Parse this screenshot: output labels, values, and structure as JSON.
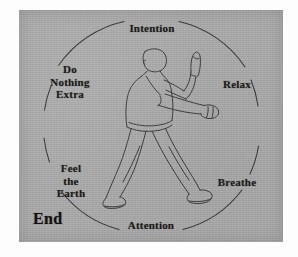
{
  "figure": {
    "background_color": "#a9a9a9",
    "ink_color": "#1d1b19",
    "page_color": "#fdfdfd"
  },
  "cycle": {
    "labels": [
      {
        "id": "intention",
        "text": "Intention",
        "position": "top"
      },
      {
        "id": "relax",
        "text": "Relax",
        "position": "upper-right"
      },
      {
        "id": "breathe",
        "text": "Breathe",
        "position": "lower-right"
      },
      {
        "id": "attention",
        "text": "Attention",
        "position": "bottom"
      },
      {
        "id": "feel_earth",
        "text": "Feel\nthe\nEarth",
        "position": "lower-left"
      },
      {
        "id": "do_nothing",
        "text": "Do\nNothing\nExtra",
        "position": "upper-left"
      }
    ],
    "end_marker": "End"
  },
  "illustration": {
    "name": "tai-chi-figure",
    "description": "Line drawing of a person in a bow stance with one hand raised vertically and the other arm extended forward in a fist"
  }
}
